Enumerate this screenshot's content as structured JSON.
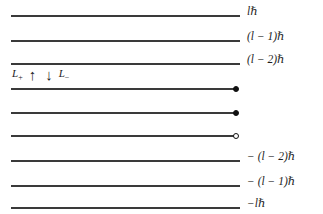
{
  "diagram": {
    "line_color": "#3a3a3a",
    "marker_color": "#111111",
    "background": "#ffffff",
    "line_start_x": 11,
    "line_end_x": 240,
    "levels": [
      {
        "label": "lℏ",
        "y": 15,
        "marker": "none",
        "line_end": 240
      },
      {
        "label": "(l − 1)ℏ",
        "y": 40,
        "marker": "none",
        "line_end": 240
      },
      {
        "label": "(l − 2)ℏ",
        "y": 63,
        "marker": "none",
        "line_end": 240
      },
      {
        "label": "",
        "y": 88,
        "marker": "filled",
        "line_end": 234
      },
      {
        "label": "",
        "y": 112,
        "marker": "filled",
        "line_end": 234
      },
      {
        "label": "",
        "y": 135,
        "marker": "hollow",
        "line_end": 234
      },
      {
        "label": "− (l − 2)ℏ",
        "y": 160,
        "marker": "none",
        "line_end": 240
      },
      {
        "label": "− (l − 1)ℏ",
        "y": 185,
        "marker": "none",
        "line_end": 240
      }
    ],
    "extra_levels": [
      {
        "label": "−lℏ",
        "y": 207,
        "marker": "none",
        "line_end": 240
      }
    ],
    "ladder": {
      "raising_operator": "L",
      "raising_subscript": "+",
      "up_arrow": "↑",
      "down_arrow": "↓",
      "lowering_operator": "L",
      "lowering_subscript": "−"
    }
  }
}
